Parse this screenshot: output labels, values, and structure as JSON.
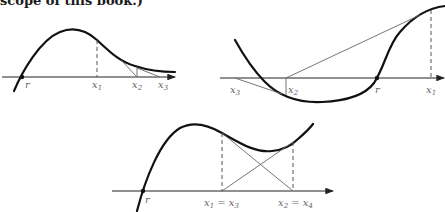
{
  "caption": "scope of this book.)",
  "diagrams": [
    {
      "id": "converging",
      "labels": {
        "root": "r",
        "x1": "x",
        "x1_sub": "1",
        "x2": "x",
        "x2_sub": "2",
        "x3": "x",
        "x3_sub": "3"
      }
    },
    {
      "id": "diverging",
      "labels": {
        "root": "r",
        "x1": "x",
        "x1_sub": "1",
        "x2": "x",
        "x2_sub": "2",
        "x3": "x",
        "x3_sub": "3"
      }
    },
    {
      "id": "cycling",
      "labels": {
        "root": "r",
        "x13": "x",
        "x13_sub_a": "1",
        "eq_a": " = x",
        "x13_sub_b": "3",
        "x24": "x",
        "x24_sub_a": "2",
        "eq_b": " = x",
        "x24_sub_b": "4"
      }
    }
  ]
}
